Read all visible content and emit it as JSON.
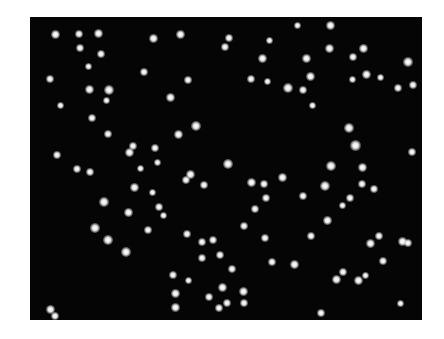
{
  "image": {
    "description": "Fluorescence-style micrograph: bright white spots scattered on a black background",
    "background_color": "#050505",
    "spot_color": "#ffffff",
    "frame": {
      "x": 30,
      "y": 17,
      "width": 392,
      "height": 303
    },
    "spots": [
      [
        55,
        34,
        7
      ],
      [
        79,
        34,
        6
      ],
      [
        98,
        33,
        7
      ],
      [
        153,
        38,
        7
      ],
      [
        180,
        34,
        7
      ],
      [
        229,
        38,
        6
      ],
      [
        225,
        47,
        6
      ],
      [
        330,
        25,
        7
      ],
      [
        297,
        25,
        5
      ],
      [
        306,
        58,
        7
      ],
      [
        329,
        48,
        7
      ],
      [
        363,
        48,
        7
      ],
      [
        353,
        57,
        6
      ],
      [
        408,
        62,
        8
      ],
      [
        366,
        74,
        7
      ],
      [
        310,
        76,
        7
      ],
      [
        262,
        58,
        7
      ],
      [
        269,
        40,
        5
      ],
      [
        80,
        48,
        6
      ],
      [
        101,
        54,
        6
      ],
      [
        88,
        66,
        5
      ],
      [
        50,
        79,
        6
      ],
      [
        144,
        72,
        6
      ],
      [
        188,
        80,
        6
      ],
      [
        251,
        79,
        6
      ],
      [
        267,
        81,
        5
      ],
      [
        288,
        88,
        8
      ],
      [
        303,
        90,
        6
      ],
      [
        312,
        105,
        5
      ],
      [
        398,
        88,
        6
      ],
      [
        413,
        85,
        6
      ],
      [
        352,
        79,
        5
      ],
      [
        380,
        77,
        5
      ],
      [
        109,
        90,
        8
      ],
      [
        89,
        89,
        7
      ],
      [
        106,
        100,
        5
      ],
      [
        170,
        97,
        7
      ],
      [
        60,
        105,
        5
      ],
      [
        92,
        118,
        6
      ],
      [
        196,
        126,
        8
      ],
      [
        178,
        134,
        7
      ],
      [
        108,
        134,
        6
      ],
      [
        133,
        146,
        6
      ],
      [
        155,
        148,
        6
      ],
      [
        129,
        152,
        7
      ],
      [
        57,
        155,
        6
      ],
      [
        77,
        169,
        6
      ],
      [
        90,
        172,
        6
      ],
      [
        140,
        168,
        5
      ],
      [
        157,
        162,
        5
      ],
      [
        190,
        174,
        7
      ],
      [
        228,
        164,
        8
      ],
      [
        186,
        180,
        6
      ],
      [
        349,
        128,
        8
      ],
      [
        355,
        145,
        9
      ],
      [
        331,
        166,
        8
      ],
      [
        362,
        167,
        7
      ],
      [
        325,
        186,
        8
      ],
      [
        362,
        184,
        6
      ],
      [
        374,
        189,
        6
      ],
      [
        412,
        152,
        6
      ],
      [
        251,
        182,
        7
      ],
      [
        264,
        184,
        6
      ],
      [
        282,
        177,
        7
      ],
      [
        204,
        185,
        6
      ],
      [
        134,
        187,
        7
      ],
      [
        152,
        192,
        5
      ],
      [
        159,
        207,
        6
      ],
      [
        104,
        202,
        8
      ],
      [
        128,
        212,
        7
      ],
      [
        148,
        230,
        6
      ],
      [
        163,
        215,
        5
      ],
      [
        95,
        228,
        8
      ],
      [
        108,
        240,
        8
      ],
      [
        126,
        252,
        8
      ],
      [
        187,
        234,
        6
      ],
      [
        202,
        242,
        6
      ],
      [
        244,
        226,
        6
      ],
      [
        255,
        209,
        6
      ],
      [
        266,
        198,
        6
      ],
      [
        303,
        196,
        6
      ],
      [
        327,
        220,
        7
      ],
      [
        350,
        198,
        6
      ],
      [
        342,
        205,
        5
      ],
      [
        265,
        238,
        6
      ],
      [
        311,
        236,
        6
      ],
      [
        370,
        243,
        7
      ],
      [
        379,
        236,
        6
      ],
      [
        402,
        241,
        7
      ],
      [
        408,
        243,
        6
      ],
      [
        213,
        240,
        6
      ],
      [
        220,
        255,
        6
      ],
      [
        202,
        258,
        6
      ],
      [
        272,
        262,
        6
      ],
      [
        294,
        264,
        7
      ],
      [
        383,
        261,
        6
      ],
      [
        232,
        269,
        6
      ],
      [
        173,
        275,
        6
      ],
      [
        188,
        280,
        5
      ],
      [
        336,
        279,
        7
      ],
      [
        343,
        272,
        6
      ],
      [
        358,
        280,
        7
      ],
      [
        365,
        275,
        5
      ],
      [
        222,
        287,
        7
      ],
      [
        243,
        291,
        7
      ],
      [
        175,
        293,
        7
      ],
      [
        209,
        297,
        6
      ],
      [
        227,
        303,
        6
      ],
      [
        244,
        303,
        6
      ],
      [
        175,
        307,
        7
      ],
      [
        219,
        308,
        6
      ],
      [
        321,
        313,
        6
      ],
      [
        50,
        309,
        7
      ],
      [
        55,
        316,
        6
      ],
      [
        400,
        303,
        5
      ]
    ]
  }
}
